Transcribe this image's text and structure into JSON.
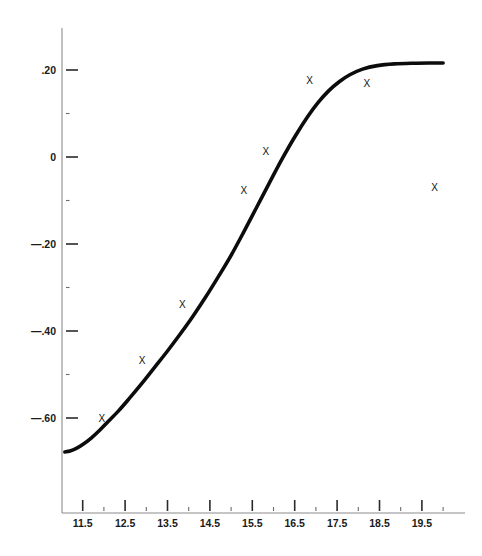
{
  "chart_data": {
    "type": "scatter",
    "title": "",
    "subtitle": "",
    "xlabel": "",
    "ylabel": "",
    "xlim": [
      10.98,
      20.02
    ],
    "ylim": [
      -0.73,
      0.265
    ],
    "grid": false,
    "legend": null,
    "x_ticks": [
      11.5,
      12.5,
      13.5,
      14.5,
      15.5,
      16.5,
      17.5,
      18.5,
      19.5
    ],
    "x_tick_labels": [
      "11.5",
      "12.5",
      "13.5",
      "14.5",
      "15.5",
      "16.5",
      "17.5",
      "18.5",
      "19.5"
    ],
    "x_minor_ticks": [
      11.0,
      12.0,
      13.0,
      14.0,
      15.0,
      16.0,
      17.0,
      18.0,
      19.0,
      20.0
    ],
    "y_ticks": [
      0.2,
      0.0,
      -0.2,
      -0.4,
      -0.6
    ],
    "y_tick_labels": [
      ".20",
      "0",
      "—.20",
      "—.40",
      "—.60"
    ],
    "y_minor_ticks": [
      0.1,
      -0.1,
      -0.3,
      -0.5
    ],
    "marker_symbol": "X",
    "points": [
      {
        "x": 11.95,
        "y": -0.6
      },
      {
        "x": 12.9,
        "y": -0.468
      },
      {
        "x": 13.85,
        "y": -0.338
      },
      {
        "x": 15.3,
        "y": -0.076
      },
      {
        "x": 15.82,
        "y": 0.012
      },
      {
        "x": 16.85,
        "y": 0.176
      },
      {
        "x": 18.2,
        "y": 0.17
      },
      {
        "x": 19.8,
        "y": -0.07
      }
    ],
    "series": [
      {
        "name": "fitted curve",
        "type": "line",
        "x": [
          11.08,
          11.2,
          11.35,
          11.5,
          11.7,
          11.9,
          12.1,
          12.35,
          12.6,
          12.9,
          13.2,
          13.5,
          13.8,
          14.1,
          14.4,
          14.7,
          15.0,
          15.3,
          15.6,
          15.9,
          16.2,
          16.5,
          16.8,
          17.05,
          17.3,
          17.55,
          17.8,
          18.1,
          18.45,
          18.85,
          19.3,
          19.75,
          20.0
        ],
        "y": [
          -0.678,
          -0.676,
          -0.67,
          -0.661,
          -0.646,
          -0.628,
          -0.608,
          -0.583,
          -0.555,
          -0.52,
          -0.483,
          -0.446,
          -0.407,
          -0.366,
          -0.322,
          -0.275,
          -0.226,
          -0.172,
          -0.116,
          -0.06,
          -0.005,
          0.046,
          0.092,
          0.125,
          0.152,
          0.173,
          0.189,
          0.202,
          0.21,
          0.214,
          0.2155,
          0.216,
          0.216
        ]
      }
    ]
  },
  "style": {
    "curve_color": "#0c0c0c",
    "marker_color": "#121212",
    "axis_color": "#8c8c8c",
    "tick_color": "#2a2a2a",
    "label_color": "#1a1a1a",
    "background": "#ffffff"
  },
  "axes_pixels": {
    "x_origin_px": 82.7,
    "x_scale_px_per_unit": 42.4,
    "y_zero_px": 157,
    "y_scale_px_per_unit": 435,
    "spine_x_px": 62,
    "spine_top_px": 28,
    "spine_bottom_px": 513,
    "x_axis_right_px": 465
  }
}
